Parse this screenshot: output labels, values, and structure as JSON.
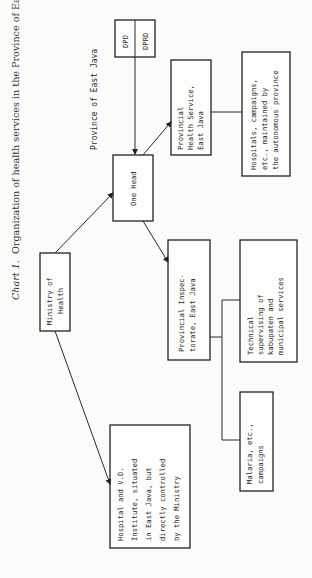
{
  "caption": {
    "label": "Chart 1.",
    "text": "Organization of health services in the Province of East Java"
  },
  "region_label": "Province of East Java",
  "nodes": {
    "dpd": "DPD",
    "dprd": "DPRD",
    "one_head": "One Head",
    "ministry": [
      "Ministry of",
      "Health"
    ],
    "prov_health_service": [
      "Provincial",
      "Health Service,",
      "East Java"
    ],
    "hospitals_campaigns": [
      "Hospitals, campaigns,",
      "etc., maintained by",
      "the autonomous province"
    ],
    "prov_inspectorate": [
      "Provincial Inspec-",
      "torate, East Java"
    ],
    "technical_supervising": [
      "Technical",
      "supervising of",
      "kabupaten and",
      "municipal services"
    ],
    "malaria": [
      "Malaria, etc.,",
      "campaigns"
    ],
    "hospital_vd": [
      "Hospital and V.D.",
      "Institute, situated",
      "in East Java, but",
      "directly controlled",
      "by the Ministry"
    ]
  },
  "edges": [
    {
      "from": "dpd_dprd",
      "to": "one_head",
      "arrow": true
    },
    {
      "from": "ministry",
      "to": "one_head",
      "arrow": true
    },
    {
      "from": "ministry",
      "to": "hospital_vd",
      "arrow": true
    },
    {
      "from": "one_head",
      "to": "prov_health_service",
      "arrow": true
    },
    {
      "from": "one_head",
      "to": "prov_inspectorate",
      "arrow": true
    },
    {
      "from": "prov_health_service",
      "to": "hospitals_campaigns",
      "arrow": false
    },
    {
      "from": "prov_inspectorate",
      "to": "technical_supervising",
      "arrow": false
    },
    {
      "from": "prov_inspectorate",
      "to": "malaria",
      "arrow": false
    }
  ]
}
